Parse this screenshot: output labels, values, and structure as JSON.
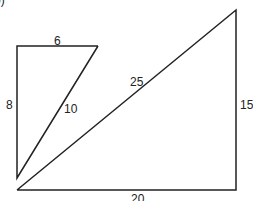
{
  "figure": {
    "part_label": "b)",
    "small_triangle": {
      "top_side": "6",
      "left_side": "8",
      "hypotenuse": "10"
    },
    "large_triangle": {
      "bottom_side": "20",
      "right_side": "15",
      "hypotenuse": "25"
    },
    "colors": {
      "stroke": "#222222",
      "background": "#ffffff"
    }
  }
}
